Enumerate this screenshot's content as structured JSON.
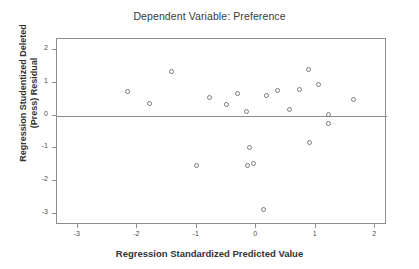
{
  "chart": {
    "title": "Dependent Variable: Preference",
    "x_axis_title": "Regression Standardized Predicted Value",
    "y_axis_title_line1": "Regression Studentized Deleted",
    "y_axis_title_line2": "(Press) Residual",
    "point_color": "#7a7a7a",
    "axis_color": "#8d8d8d",
    "text_color": "#333333"
  },
  "chart_data": {
    "type": "scatter",
    "title": "Dependent Variable: Preference",
    "xlabel": "Regression Standardized Predicted Value",
    "ylabel": "Regression Studentized Deleted (Press) Residual",
    "xlim": [
      -3.35,
      2.2
    ],
    "ylim": [
      -3.35,
      2.35
    ],
    "xticks": [
      -3,
      -2,
      -1,
      0,
      1,
      2
    ],
    "xtick_labels": [
      "-3",
      "-2",
      "-1",
      "0",
      "1",
      "2"
    ],
    "yticks": [
      2,
      1,
      0,
      -1,
      -2,
      -3
    ],
    "ytick_labels": [
      "2",
      "1",
      "0",
      "-1",
      "-2",
      "-3"
    ],
    "grid": false,
    "legend": null,
    "reference_line_y": 0,
    "marker": "open-circle",
    "points": [
      {
        "x": -2.16,
        "y": 0.73
      },
      {
        "x": -1.8,
        "y": 0.36
      },
      {
        "x": -1.43,
        "y": 1.34
      },
      {
        "x": -1.0,
        "y": -1.52
      },
      {
        "x": -0.79,
        "y": 0.56
      },
      {
        "x": -0.5,
        "y": 0.35
      },
      {
        "x": -0.32,
        "y": 0.69
      },
      {
        "x": -0.17,
        "y": 0.13
      },
      {
        "x": -0.15,
        "y": -1.53
      },
      {
        "x": -0.11,
        "y": -0.98
      },
      {
        "x": -0.04,
        "y": -1.48
      },
      {
        "x": 0.13,
        "y": -2.88
      },
      {
        "x": 0.17,
        "y": 0.61
      },
      {
        "x": 0.35,
        "y": 0.78
      },
      {
        "x": 0.56,
        "y": 0.18
      },
      {
        "x": 0.73,
        "y": 0.8
      },
      {
        "x": 0.88,
        "y": 1.43
      },
      {
        "x": 0.9,
        "y": -0.81
      },
      {
        "x": 1.04,
        "y": 0.97
      },
      {
        "x": 1.22,
        "y": 0.03
      },
      {
        "x": 1.22,
        "y": -0.25
      },
      {
        "x": 1.63,
        "y": 0.49
      }
    ]
  }
}
